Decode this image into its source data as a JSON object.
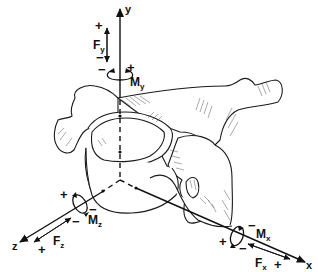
{
  "figure": {
    "axes": {
      "y": {
        "label": "y"
      },
      "x": {
        "label": "x"
      },
      "z": {
        "label": "z"
      }
    },
    "forces": {
      "fy": {
        "symbol": "F",
        "subscript": "y",
        "plus": "+",
        "minus": "−"
      },
      "fx": {
        "symbol": "F",
        "subscript": "x",
        "plus": "+",
        "minus": "−"
      },
      "fz": {
        "symbol": "F",
        "subscript": "z",
        "plus": "+",
        "minus": "−"
      }
    },
    "moments": {
      "my": {
        "symbol": "M",
        "subscript": "y",
        "plus": "+",
        "minus": "−"
      },
      "mx": {
        "symbol": "M",
        "subscript": "x",
        "plus": "+",
        "minus": "−"
      },
      "mz": {
        "symbol": "M",
        "subscript": "z",
        "plus": "+",
        "minus": "−"
      }
    },
    "colors": {
      "ink": "#111111",
      "background": "#ffffff"
    }
  }
}
